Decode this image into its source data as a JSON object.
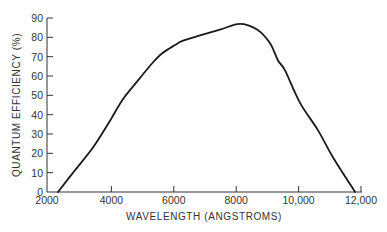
{
  "chart_data": {
    "type": "line",
    "title": "",
    "xlabel": "WAVELENGTH (ANGSTROMS)",
    "ylabel": "QUANTUM EFFICIENCY (%)",
    "xlim": [
      2000,
      12000
    ],
    "ylim": [
      0,
      90
    ],
    "grid": false,
    "legend": null,
    "x_ticks": [
      2000,
      4000,
      6000,
      8000,
      10000,
      12000
    ],
    "x_tick_labels": [
      "2000",
      "4000",
      "6000",
      "8000",
      "10,000",
      "12,000"
    ],
    "y_ticks": [
      0,
      10,
      20,
      30,
      40,
      50,
      60,
      70,
      80,
      90
    ],
    "y_tick_labels": [
      "0",
      "10",
      "20",
      "30",
      "40",
      "50",
      "60",
      "70",
      "80",
      "90"
    ],
    "series": [
      {
        "name": "Quantum efficiency",
        "color": "#1a1a1a",
        "x": [
          2290,
          2770,
          3410,
          3960,
          4370,
          4920,
          5330,
          5650,
          6040,
          6260,
          6840,
          7480,
          8120,
          8670,
          9080,
          9340,
          9560,
          10050,
          10620,
          11100,
          11810
        ],
        "y": [
          0,
          10,
          23,
          37,
          48,
          59,
          67,
          72,
          76,
          78,
          81,
          84,
          87,
          84,
          77,
          68,
          63,
          46,
          32,
          18,
          0
        ]
      }
    ]
  },
  "colors": {
    "axis": "#333333",
    "line": "#1a1a1a",
    "background": "#ffffff"
  }
}
